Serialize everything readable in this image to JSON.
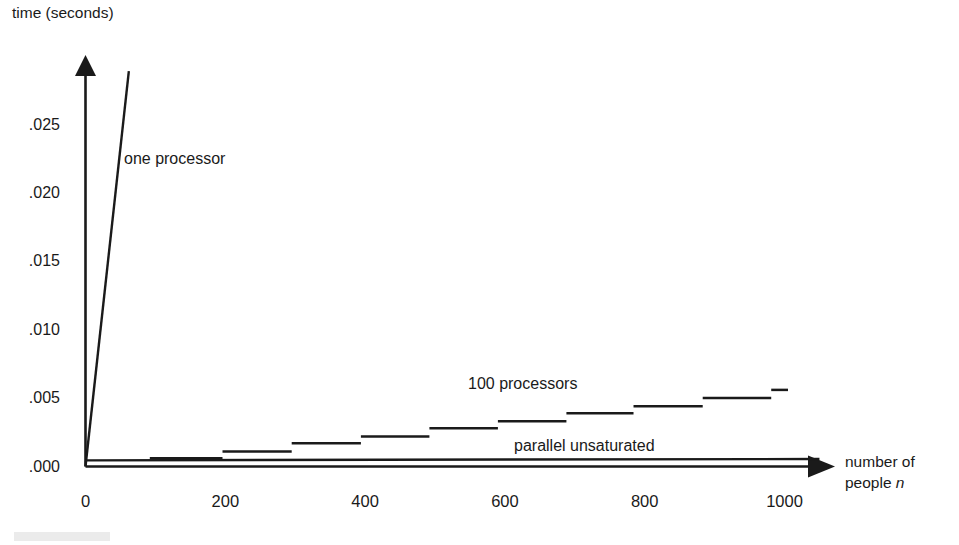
{
  "figure": {
    "background_color": "#ffffff",
    "ink_color": "#1a1a1a"
  },
  "chart_data": {
    "type": "line",
    "title": "",
    "subtitle": "",
    "xlabel": "number of people n",
    "ylabel": "time (seconds)",
    "xlim": [
      0,
      1195
    ],
    "ylim": [
      0.0,
      0.029
    ],
    "grid": false,
    "legend_position": "inline-annotations",
    "x_ticks": [
      0,
      200,
      400,
      600,
      800,
      1000
    ],
    "x_tick_labels": [
      "0",
      "200",
      "400",
      "600",
      "800",
      "1000"
    ],
    "y_ticks": [
      0.0,
      0.005,
      0.01,
      0.015,
      0.02,
      0.025
    ],
    "y_tick_labels": [
      ".000",
      ".005",
      ".010",
      ".015",
      ".020",
      ".025"
    ],
    "axis_style": "arrow-tipped L-shaped axes, no tick marks",
    "series": [
      {
        "name": "one processor",
        "style": "straight-line",
        "label_text": "one processor",
        "x": [
          0,
          62
        ],
        "values": [
          0.0,
          0.0289
        ],
        "note": "steep linear growth, line clipped at top of plot"
      },
      {
        "name": "100 processors",
        "style": "step",
        "label_text": "100 processors",
        "x_breaks": [
          92,
          196,
          295,
          394,
          492,
          590,
          688,
          784,
          883,
          981,
          1005
        ],
        "step_x_start": [
          92,
          196,
          295,
          394,
          492,
          590,
          688,
          784,
          883,
          981
        ],
        "step_x_end": [
          196,
          295,
          394,
          492,
          590,
          688,
          784,
          883,
          981,
          1005
        ],
        "values": [
          0.0006,
          0.0011,
          0.0017,
          0.0022,
          0.0028,
          0.0033,
          0.0039,
          0.0044,
          0.005,
          0.0056
        ],
        "note": "rising staircase of 10 flat segments, each ~100 people wide"
      },
      {
        "name": "parallel unsaturated",
        "style": "straight-line",
        "label_text": "parallel unsaturated",
        "x": [
          0,
          1050
        ],
        "values": [
          0.00045,
          0.00055
        ],
        "note": "nearly flat line just above the horizontal axis"
      }
    ]
  },
  "annotations": {
    "one_processor": "one processor",
    "hundred_processors": "100 processors",
    "parallel_unsaturated": "parallel unsaturated"
  },
  "axes": {
    "y_title": "time (seconds)",
    "x_title_line1": "number of",
    "x_title_line2_prefix": "people ",
    "x_title_line2_italic": "n"
  }
}
